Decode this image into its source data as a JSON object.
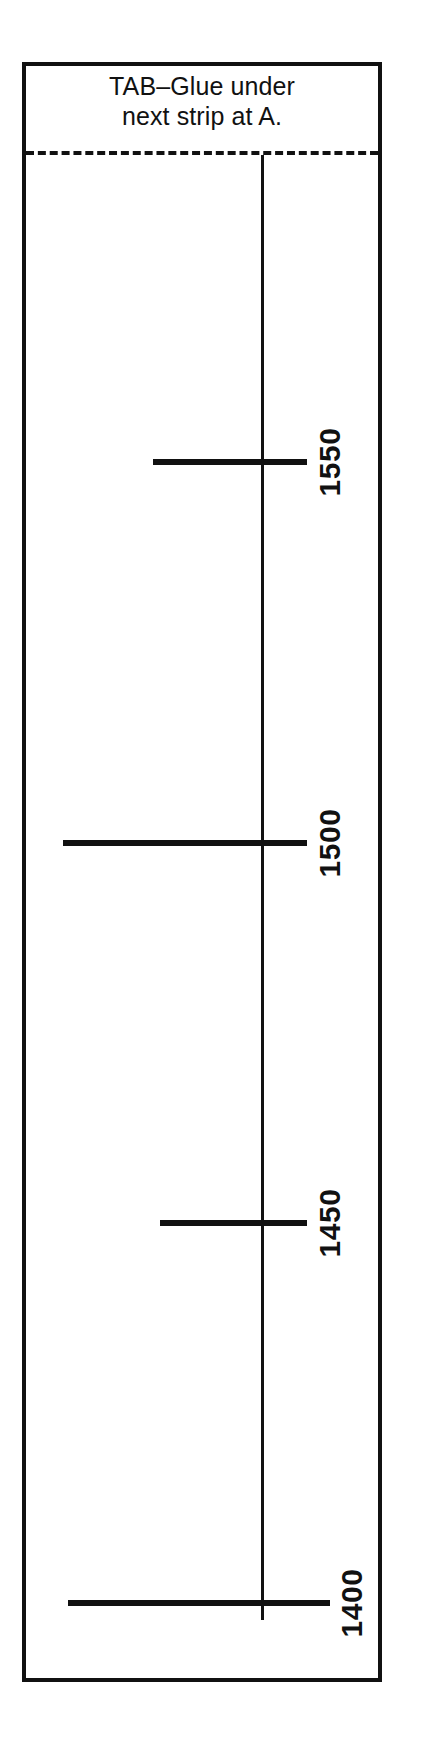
{
  "figure": {
    "type": "technical-template-diagram",
    "background_color": "#ffffff",
    "ink_color": "#111111",
    "header": {
      "line1": "TAB–Glue under",
      "line2": "next strip at A."
    },
    "fold_line": {
      "name": "glue-fold-line",
      "style": "dashed"
    },
    "axis": {
      "name": "center-vertical-axis",
      "orientation": "vertical"
    }
  },
  "chart_data": {
    "type": "bar",
    "title": "TAB–Glue under next strip at A.",
    "xlabel": "",
    "ylabel": "",
    "orientation": "horizontal",
    "grid": false,
    "legend": null,
    "note": "Horizontal rules crossing a central vertical baseline; each rule is annotated with a rotated numeric label giving the value at that row.",
    "categories": [
      "1550",
      "1500",
      "1450",
      "1400"
    ],
    "values": [
      1550,
      1500,
      1450,
      1400
    ],
    "tick_labels": [
      "1550",
      "1500",
      "1450",
      "1400"
    ],
    "rows": [
      {
        "label": "1550",
        "value": 1550,
        "y": 462,
        "rule_left": 153,
        "rule_right": 307,
        "label_x": 330,
        "label_y": 462
      },
      {
        "label": "1500",
        "value": 1500,
        "y": 843,
        "rule_left": 63,
        "rule_right": 307,
        "label_x": 330,
        "label_y": 843
      },
      {
        "label": "1450",
        "value": 1450,
        "y": 1223,
        "rule_left": 160,
        "rule_right": 307,
        "label_x": 330,
        "label_y": 1223
      },
      {
        "label": "1400",
        "value": 1400,
        "y": 1603,
        "rule_left": 68,
        "rule_right": 330,
        "label_x": 352,
        "label_y": 1603
      }
    ]
  }
}
